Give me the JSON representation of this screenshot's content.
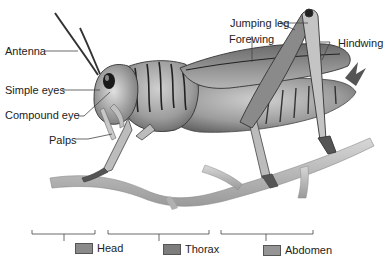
{
  "diagram": {
    "labels": [
      {
        "id": "antenna",
        "text": "Antenna"
      },
      {
        "id": "simple-eyes",
        "text": "Simple eyes"
      },
      {
        "id": "compound-eye",
        "text": "Compound eye"
      },
      {
        "id": "palps",
        "text": "Palps"
      },
      {
        "id": "jumping-leg",
        "text": "Jumping leg"
      },
      {
        "id": "forewing",
        "text": "Forewing"
      },
      {
        "id": "hindwing",
        "text": "Hindwing"
      }
    ],
    "regions": [
      {
        "id": "head",
        "text": "Head",
        "color": "#8a8a8a"
      },
      {
        "id": "thorax",
        "text": "Thorax",
        "color": "#7d7d7d"
      },
      {
        "id": "abdomen",
        "text": "Abdomen",
        "color": "#959595"
      }
    ]
  }
}
